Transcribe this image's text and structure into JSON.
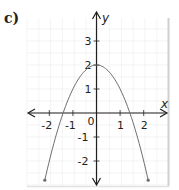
{
  "label": "c)",
  "chart_data": {
    "type": "line",
    "title": "",
    "xlabel": "x",
    "ylabel": "y",
    "xlim": [
      -2.8,
      2.9
    ],
    "ylim": [
      -2.9,
      3.9
    ],
    "x_ticks": [
      -2,
      -1,
      0,
      1,
      2
    ],
    "y_ticks": [
      -2,
      -1,
      1,
      2,
      3
    ],
    "x_tick_labels": [
      "-2",
      "-1",
      "0",
      "1",
      "2"
    ],
    "y_tick_labels": [
      "-2",
      "-1",
      "1",
      "2",
      "3"
    ],
    "grid": true,
    "series": [
      {
        "name": "y = 2 - x^2",
        "x": [
          -2.19,
          -2,
          -1.5,
          -1.41,
          -1,
          -0.5,
          0,
          0.5,
          1,
          1.41,
          1.5,
          2,
          2.19
        ],
        "y": [
          -2.8,
          -2,
          -0.25,
          0,
          1,
          1.75,
          2,
          1.75,
          1,
          0,
          -0.25,
          -2,
          -2.8
        ],
        "color": "#6d6e71",
        "endpoints": "arrow-dots"
      }
    ],
    "colors": {
      "axis": "#231f20",
      "curve": "#6d6e71",
      "grid": "#ececec",
      "frame": "#cfcfcf"
    }
  }
}
